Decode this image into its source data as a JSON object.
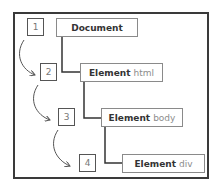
{
  "diagram": {
    "type": "dom-tree-traversal",
    "steps": [
      "1",
      "2",
      "3",
      "4"
    ],
    "nodes": [
      {
        "keyword": "Document",
        "tag": ""
      },
      {
        "keyword": "Element",
        "tag": "html"
      },
      {
        "keyword": "Element",
        "tag": "body"
      },
      {
        "keyword": "Element",
        "tag": "div"
      }
    ],
    "colors": {
      "frame": "#3a3a3a",
      "node_border": "#8a8a8a",
      "connector": "#333333",
      "arrow": "#555555",
      "keyword_text": "#333333",
      "tag_text": "#8c8c8c"
    }
  }
}
